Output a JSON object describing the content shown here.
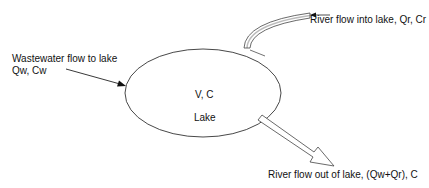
{
  "diagram": {
    "lake": {
      "variables": "V, C",
      "name": "Lake"
    },
    "inflows": [
      {
        "id": "wastewater",
        "label": "Wastewater flow to lake",
        "variables": "Qw, Cw",
        "arrow_style": "line"
      },
      {
        "id": "river-in",
        "label": "River flow into lake, Qr, Cr",
        "arrow_style": "double-line-curved"
      }
    ],
    "outflows": [
      {
        "id": "river-out",
        "label": "River flow out of lake, (Qw+Qr), C",
        "arrow_style": "hollow-block"
      }
    ],
    "colors": {
      "background": "#ffffff",
      "stroke": "#222222",
      "text": "#111111"
    }
  }
}
